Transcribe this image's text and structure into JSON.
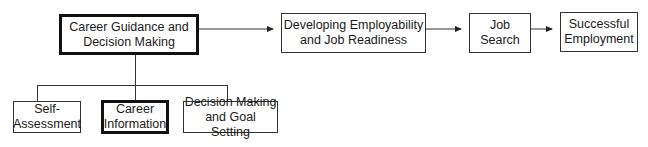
{
  "diagram": {
    "type": "flowchart",
    "nodes": {
      "career_guidance": {
        "label": "Career Guidance and\nDecision Making",
        "emphasis": "bold-border"
      },
      "developing": {
        "label": "Developing Employability\nand Job Readiness"
      },
      "job_search": {
        "label": "Job\nSearch"
      },
      "successful": {
        "label": "Successful\nEmployment"
      },
      "self_assessment": {
        "label": "Self-\nAssessment"
      },
      "career_information": {
        "label": "Career\nInformation",
        "emphasis": "bold-border"
      },
      "decision_goal": {
        "label": "Decision Making\nand Goal Setting"
      }
    },
    "edges": [
      {
        "from": "career_guidance",
        "to": "developing",
        "type": "arrow"
      },
      {
        "from": "developing",
        "to": "job_search",
        "type": "arrow"
      },
      {
        "from": "job_search",
        "to": "successful",
        "type": "arrow"
      },
      {
        "from": "career_guidance",
        "to": "self_assessment",
        "type": "tree"
      },
      {
        "from": "career_guidance",
        "to": "career_information",
        "type": "tree"
      },
      {
        "from": "career_guidance",
        "to": "decision_goal",
        "type": "tree"
      }
    ]
  }
}
